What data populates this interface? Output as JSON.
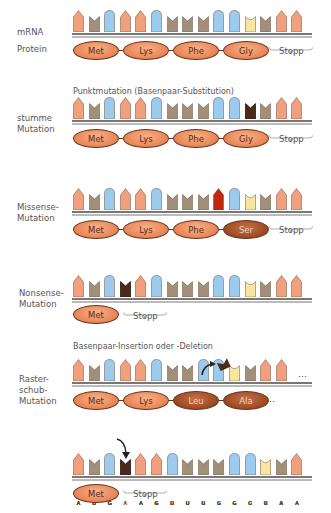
{
  "colors": {
    "A": "#f0a07c",
    "U": "#a0907a",
    "G": "#9ccbee",
    "C": "#f6e6a0",
    "U_mut": "#4a2a1a",
    "A_mut": "#c0280c",
    "protein_normal": "#ea8a5c",
    "protein_mutant": "#a24e28"
  },
  "headings": {
    "point_mutation": "Punktmutation (Basenpaar-Substitution)",
    "indel": "Basenpaar-Insertion oder -Deletion"
  },
  "rows": [
    {
      "id": "wildtype",
      "labels": [
        "mRNA",
        "Protein"
      ],
      "sequence": [
        "A",
        "U",
        "G",
        "A",
        "A",
        "G",
        "U",
        "U",
        "U",
        "G",
        "G",
        "C",
        "U",
        "A",
        "A"
      ],
      "mutated_index": null,
      "proteins": [
        {
          "name": "Met",
          "mutant": false
        },
        {
          "name": "Lys",
          "mutant": false
        },
        {
          "name": "Phe",
          "mutant": false
        },
        {
          "name": "Gly",
          "mutant": false
        }
      ],
      "stop_label": "Stopp"
    },
    {
      "id": "silent",
      "label": "stumme Mutation",
      "sequence": [
        "A",
        "U",
        "G",
        "A",
        "A",
        "G",
        "U",
        "U",
        "U",
        "G",
        "G",
        "U",
        "U",
        "A",
        "A"
      ],
      "mutated_index": 11,
      "proteins": [
        {
          "name": "Met",
          "mutant": false
        },
        {
          "name": "Lys",
          "mutant": false
        },
        {
          "name": "Phe",
          "mutant": false
        },
        {
          "name": "Gly",
          "mutant": false
        }
      ],
      "stop_label": "Stopp"
    },
    {
      "id": "missense",
      "label": "Missense-Mutation",
      "sequence": [
        "A",
        "U",
        "G",
        "A",
        "A",
        "G",
        "U",
        "U",
        "U",
        "A",
        "G",
        "C",
        "U",
        "A",
        "A"
      ],
      "mutated_index": 9,
      "proteins": [
        {
          "name": "Met",
          "mutant": false
        },
        {
          "name": "Lys",
          "mutant": false
        },
        {
          "name": "Phe",
          "mutant": false
        },
        {
          "name": "Ser",
          "mutant": true
        }
      ],
      "stop_label": "Stopp"
    },
    {
      "id": "nonsense",
      "label": "Nonsense-Mutation",
      "sequence": [
        "A",
        "U",
        "G",
        "U",
        "A",
        "G",
        "U",
        "U",
        "U",
        "G",
        "G",
        "C",
        "U",
        "A",
        "A"
      ],
      "mutated_index": 3,
      "proteins": [
        {
          "name": "Met",
          "mutant": false
        }
      ],
      "stop_label": "Stopp"
    },
    {
      "id": "frameshift-deletion",
      "label": "Raster-schub-Mutation",
      "sequence": [
        "A",
        "U",
        "G",
        "A",
        "A",
        "G",
        "U",
        "U",
        "G",
        "G",
        "C",
        "U",
        "A",
        "A"
      ],
      "removed_base": "U",
      "proteins": [
        {
          "name": "Met",
          "mutant": false
        },
        {
          "name": "Lys",
          "mutant": false
        },
        {
          "name": "Leu",
          "mutant": true
        },
        {
          "name": "Ala",
          "mutant": true
        }
      ],
      "ellipsis": "…"
    },
    {
      "id": "frameshift-insertion",
      "sequence": [
        "A",
        "U",
        "G",
        "U",
        "A",
        "A",
        "G",
        "U",
        "U",
        "U",
        "G",
        "G",
        "C",
        "U",
        "A"
      ],
      "inserted_index": 3,
      "proteins": [
        {
          "name": "Met",
          "mutant": false
        }
      ],
      "stop_label": "Stopp"
    }
  ],
  "text": {
    "mRNA": "mRNA",
    "protein": "Protein",
    "silent_1": "stumme",
    "silent_2": "Mutation",
    "missense_1": "Missense-",
    "missense_2": "Mutation",
    "nonsense_1": "Nonsense-",
    "nonsense_2": "Mutation",
    "frameshift_1": "Raster-",
    "frameshift_2": "schub-",
    "frameshift_3": "Mutation",
    "stopp": "Stopp",
    "ellipsis": "…",
    "Met": "Met",
    "Lys": "Lys",
    "Phe": "Phe",
    "Gly": "Gly",
    "Ser": "Ser",
    "Leu": "Leu",
    "Ala": "Ala"
  }
}
